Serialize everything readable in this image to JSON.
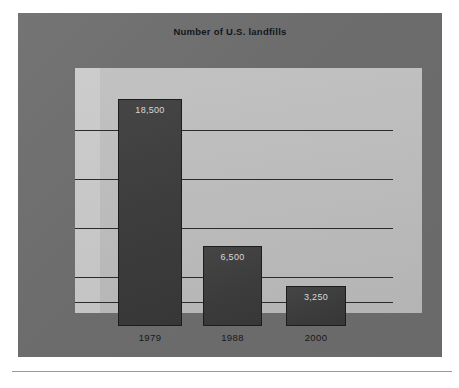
{
  "figure": {
    "title": "Number of U.S. landfills",
    "frame_color": "#6f6f6f",
    "plot_bg_color": "#bcbcbc",
    "bar_color": "#3d3d3d",
    "gridline_color": "#2b2b2b",
    "value_label_color": "#d8d8d8",
    "category_label_color": "#16181d"
  },
  "chart_data": {
    "type": "bar",
    "title": "Number of U.S. landfills",
    "xlabel": "",
    "ylabel": "",
    "categories": [
      "1979",
      "1988",
      "2000"
    ],
    "values": [
      18500,
      6500,
      3250
    ],
    "value_labels": [
      "18,500",
      "6,500",
      "3,250"
    ],
    "ylim": [
      0,
      20000
    ],
    "grid": true,
    "gridline_count": 5,
    "gridline_values": [
      16000,
      12000,
      8000,
      4000,
      2000
    ],
    "legend": null,
    "legend_position": "none",
    "tick_labels_y": []
  }
}
